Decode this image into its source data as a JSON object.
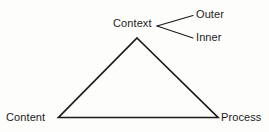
{
  "diagram": {
    "type": "triangle-model",
    "background_color": "#fdfdfc",
    "stroke_color": "#1b1b1b",
    "text_color": "#1b1b1b",
    "nodes": [
      {
        "id": "context",
        "label": "Context",
        "position": "apex-top"
      },
      {
        "id": "content",
        "label": "Content",
        "position": "vertex-bottom-left"
      },
      {
        "id": "process",
        "label": "Process",
        "position": "vertex-bottom-right"
      }
    ],
    "branches": [
      {
        "id": "outer",
        "label": "Outer",
        "from": "context",
        "position": "upper-right"
      },
      {
        "id": "inner",
        "label": "Inner",
        "from": "context",
        "position": "lower-right"
      }
    ],
    "edges": [
      {
        "from": "content",
        "to": "context"
      },
      {
        "from": "context",
        "to": "process"
      },
      {
        "from": "content",
        "to": "process"
      }
    ]
  }
}
